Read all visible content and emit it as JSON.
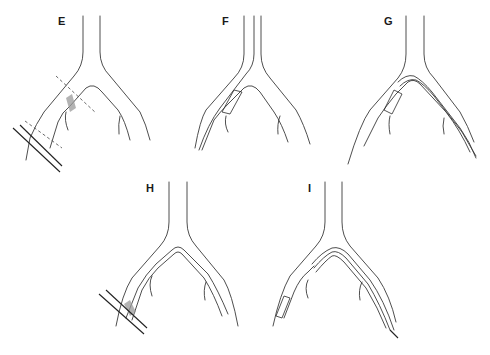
{
  "figure": {
    "colors": {
      "line": "#3a3a3a",
      "shade": "#9a9a9a",
      "background": "#ffffff"
    },
    "panels": [
      {
        "id": "E",
        "label": "E",
        "elements": [
          "vessel-bifurcation",
          "needle-puncture",
          "dashed-section-lines",
          "shaded-lesion"
        ]
      },
      {
        "id": "F",
        "label": "F",
        "elements": [
          "vessel-bifurcation",
          "sheath-balloon"
        ]
      },
      {
        "id": "G",
        "label": "G",
        "elements": [
          "vessel-bifurcation",
          "sheath-balloon",
          "crossover-wire"
        ]
      },
      {
        "id": "H",
        "label": "H",
        "elements": [
          "vessel-bifurcation",
          "crossover-wire",
          "needle-puncture",
          "shaded-lesion"
        ]
      },
      {
        "id": "I",
        "label": "I",
        "elements": [
          "vessel-bifurcation",
          "crossover-catheter",
          "sheath-tip",
          "wire-tip"
        ]
      }
    ]
  }
}
